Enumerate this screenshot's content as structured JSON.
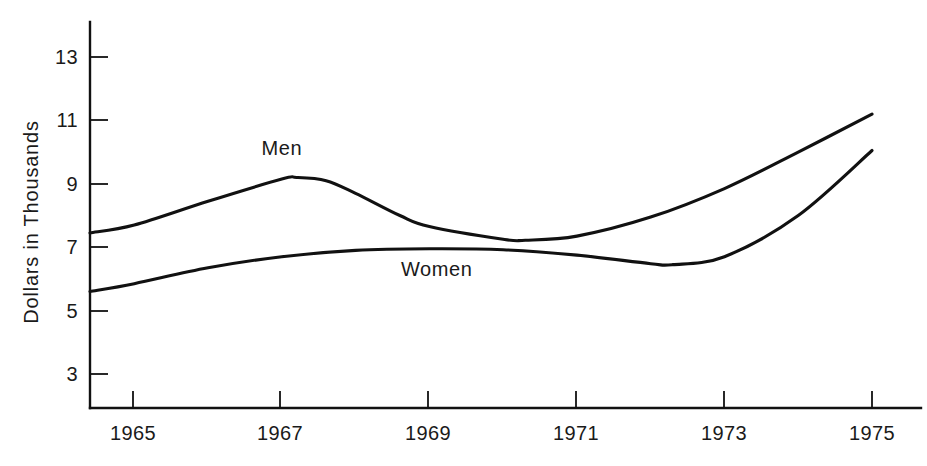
{
  "chart_data": {
    "type": "line",
    "title": "",
    "xlabel": "",
    "ylabel": "Dollars in Thousands",
    "xtick_labels": [
      "1965",
      "1967",
      "1969",
      "1971",
      "1973",
      "1975"
    ],
    "xticks": [
      1965,
      1967,
      1969,
      1971,
      1973,
      1975
    ],
    "ytick_labels": [
      "3",
      "5",
      "7",
      "9",
      "11",
      "13"
    ],
    "yticks": [
      3,
      5,
      7,
      9,
      11,
      13
    ],
    "xlim": [
      1964.4,
      1975.0
    ],
    "ylim": [
      1.5,
      14.2
    ],
    "grid": false,
    "legend_position": "inline-annotations",
    "series": [
      {
        "name": "Men",
        "label": "Men",
        "color": "#111111",
        "x": [
          1964.4,
          1965.0,
          1966.0,
          1967.0,
          1967.2,
          1967.6,
          1968.0,
          1968.6,
          1969.0,
          1970.0,
          1970.3,
          1971.0,
          1972.0,
          1973.0,
          1974.0,
          1975.0
        ],
        "values": [
          7.45,
          7.7,
          8.45,
          9.15,
          9.2,
          9.1,
          8.7,
          8.0,
          7.65,
          7.25,
          7.22,
          7.35,
          7.95,
          8.85,
          10.0,
          11.2
        ]
      },
      {
        "name": "Women",
        "label": "Women",
        "color": "#111111",
        "x": [
          1964.4,
          1965.0,
          1966.0,
          1967.0,
          1968.0,
          1969.0,
          1970.0,
          1971.0,
          1972.0,
          1972.3,
          1973.0,
          1974.0,
          1975.0
        ],
        "values": [
          5.6,
          5.85,
          6.35,
          6.7,
          6.9,
          6.95,
          6.92,
          6.75,
          6.48,
          6.45,
          6.7,
          8.0,
          10.05
        ]
      }
    ],
    "annotations": [
      {
        "text": "Men",
        "x": 1967.0,
        "y": 9.9
      },
      {
        "text": "Women",
        "x": 1969.1,
        "y": 6.1
      }
    ]
  }
}
